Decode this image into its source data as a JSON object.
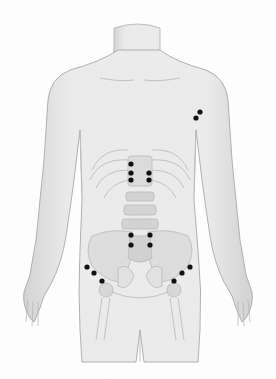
{
  "image": {
    "subject": "anatomical front-view illustration of human torso with skeleton overlay",
    "background_color": "#ffffff",
    "skin_color": "#e6e6e6",
    "outline_color": "#9a9a9a",
    "bone_color": "#cfcfcf",
    "marker_color": "#111111"
  },
  "markers": [
    {
      "group": "chest-left",
      "x": 200,
      "y": 112
    },
    {
      "group": "chest-left",
      "x": 196,
      "y": 118
    },
    {
      "group": "spine-upper",
      "x": 131,
      "y": 164
    },
    {
      "group": "spine-upper",
      "x": 131,
      "y": 173
    },
    {
      "group": "spine-upper",
      "x": 131,
      "y": 180
    },
    {
      "group": "spine-upper",
      "x": 149,
      "y": 173
    },
    {
      "group": "spine-upper",
      "x": 149,
      "y": 180
    },
    {
      "group": "spine-lower",
      "x": 131,
      "y": 235
    },
    {
      "group": "spine-lower",
      "x": 131,
      "y": 245
    },
    {
      "group": "spine-lower",
      "x": 150,
      "y": 235
    },
    {
      "group": "spine-lower",
      "x": 150,
      "y": 245
    },
    {
      "group": "hip-right",
      "x": 87,
      "y": 267
    },
    {
      "group": "hip-right",
      "x": 94,
      "y": 273
    },
    {
      "group": "hip-right",
      "x": 102,
      "y": 281
    },
    {
      "group": "hip-left",
      "x": 190,
      "y": 267
    },
    {
      "group": "hip-left",
      "x": 182,
      "y": 273
    },
    {
      "group": "hip-left",
      "x": 174,
      "y": 281
    }
  ]
}
